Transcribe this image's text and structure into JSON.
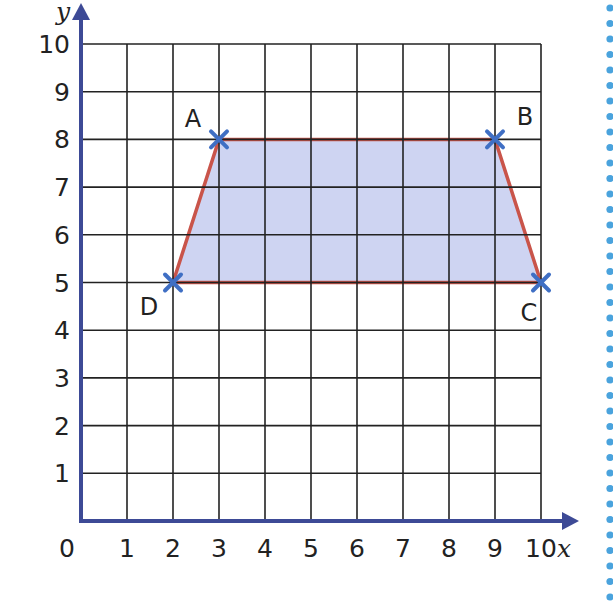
{
  "chart_data": {
    "type": "scatter",
    "title": "",
    "xlabel": "x",
    "ylabel": "y",
    "xlim": [
      0,
      10
    ],
    "ylim": [
      0,
      10
    ],
    "grid": true,
    "x_ticks": [
      "0",
      "1",
      "2",
      "3",
      "4",
      "5",
      "6",
      "7",
      "8",
      "9",
      "10"
    ],
    "y_ticks": [
      "1",
      "2",
      "3",
      "4",
      "5",
      "6",
      "7",
      "8",
      "9",
      "10"
    ],
    "shape": "trapezium",
    "points": [
      {
        "label": "A",
        "x": 3,
        "y": 8
      },
      {
        "label": "B",
        "x": 9,
        "y": 8
      },
      {
        "label": "C",
        "x": 10,
        "y": 5
      },
      {
        "label": "D",
        "x": 2,
        "y": 5
      }
    ],
    "polygon_order": [
      "A",
      "B",
      "C",
      "D"
    ]
  },
  "colors": {
    "axis": "#3d4a96",
    "grid": "#222222",
    "fill": "#c5cdf0",
    "edge": "#c9544a",
    "marker": "#3f6fc4",
    "dots": "#4aa3dd"
  }
}
